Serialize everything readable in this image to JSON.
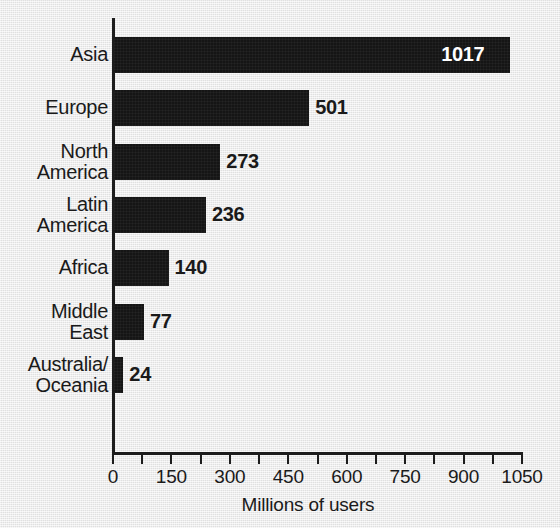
{
  "chart_data": {
    "type": "bar",
    "orientation": "horizontal",
    "title": "",
    "xlabel": "Millions of users",
    "ylabel": "",
    "categories": [
      "Asia",
      "Europe",
      "North America",
      "Latin America",
      "Africa",
      "Middle East",
      "Australia/ Oceania"
    ],
    "values": [
      1017,
      501,
      273,
      236,
      140,
      77,
      24
    ],
    "value_labels": [
      "1017",
      "501",
      "273",
      "236",
      "140",
      "77",
      "24"
    ],
    "xlim": [
      0,
      1050
    ],
    "xticks": [
      0,
      150,
      300,
      450,
      600,
      750,
      900,
      1050
    ],
    "xtick_labels": [
      "0",
      "150",
      "300",
      "450",
      "600",
      "750",
      "900",
      "1050"
    ],
    "minor_tick_step": 75,
    "grid": false,
    "legend": null,
    "bar_color": "#151515",
    "background_color": "#e9e9e9",
    "text_color": "#1a1a1a",
    "inside_label_color": "#ffffff"
  },
  "categories": [
    {
      "label_line1": "Asia",
      "label_line2": "",
      "value": 1017,
      "value_label": "1017",
      "label_inside": true
    },
    {
      "label_line1": "Europe",
      "label_line2": "",
      "value": 501,
      "value_label": "501",
      "label_inside": false
    },
    {
      "label_line1": "North",
      "label_line2": "America",
      "value": 273,
      "value_label": "273",
      "label_inside": false
    },
    {
      "label_line1": "Latin",
      "label_line2": "America",
      "value": 236,
      "value_label": "236",
      "label_inside": false
    },
    {
      "label_line1": "Africa",
      "label_line2": "",
      "value": 140,
      "value_label": "140",
      "label_inside": false
    },
    {
      "label_line1": "Middle",
      "label_line2": "East",
      "value": 77,
      "value_label": "77",
      "label_inside": false
    },
    {
      "label_line1": "Australia/",
      "label_line2": "Oceania",
      "value": 24,
      "value_label": "24",
      "label_inside": false
    }
  ],
  "axis": {
    "ticks": [
      {
        "value": 0,
        "label": "0"
      },
      {
        "value": 150,
        "label": "150"
      },
      {
        "value": 300,
        "label": "300"
      },
      {
        "value": 450,
        "label": "450"
      },
      {
        "value": 600,
        "label": "600"
      },
      {
        "value": 750,
        "label": "750"
      },
      {
        "value": 900,
        "label": "900"
      },
      {
        "value": 1050,
        "label": "1050"
      }
    ],
    "minor_ticks": [
      75,
      225,
      375,
      525,
      675,
      825,
      975
    ],
    "title": "Millions of users"
  }
}
